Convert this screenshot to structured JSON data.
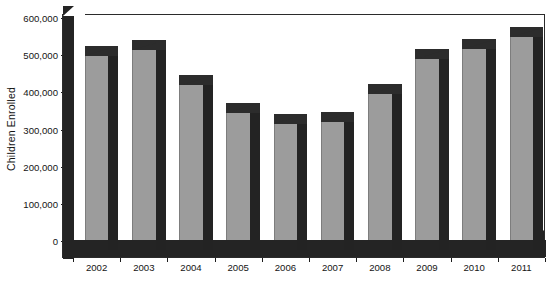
{
  "chart_data": {
    "type": "bar",
    "title": "",
    "xlabel": "",
    "ylabel": "Children Enrolled",
    "categories": [
      "2002",
      "2003",
      "2004",
      "2005",
      "2006",
      "2007",
      "2008",
      "2009",
      "2010",
      "2011"
    ],
    "values": [
      496000,
      511000,
      416000,
      342000,
      313000,
      318000,
      392000,
      487000,
      513000,
      545000
    ],
    "ylim": [
      0,
      600000
    ],
    "ytick_values": [
      0,
      100000,
      200000,
      300000,
      400000,
      500000,
      600000
    ],
    "ytick_labels": [
      "0",
      "100,000",
      "200,000",
      "300,000",
      "400,000",
      "500,000",
      "600,000"
    ],
    "grid": false,
    "legend": null,
    "series": [
      {
        "name": "Children Enrolled",
        "values": [
          496000,
          511000,
          416000,
          342000,
          313000,
          318000,
          392000,
          487000,
          513000,
          545000
        ]
      }
    ],
    "style": "3d-column",
    "colors": {
      "bar_front": "#9c9c9c",
      "bar_shadow": "#232323",
      "bar_top": "#2c2c2c",
      "axis": "#242424",
      "text": "#141414",
      "background": "#ffffff"
    }
  }
}
